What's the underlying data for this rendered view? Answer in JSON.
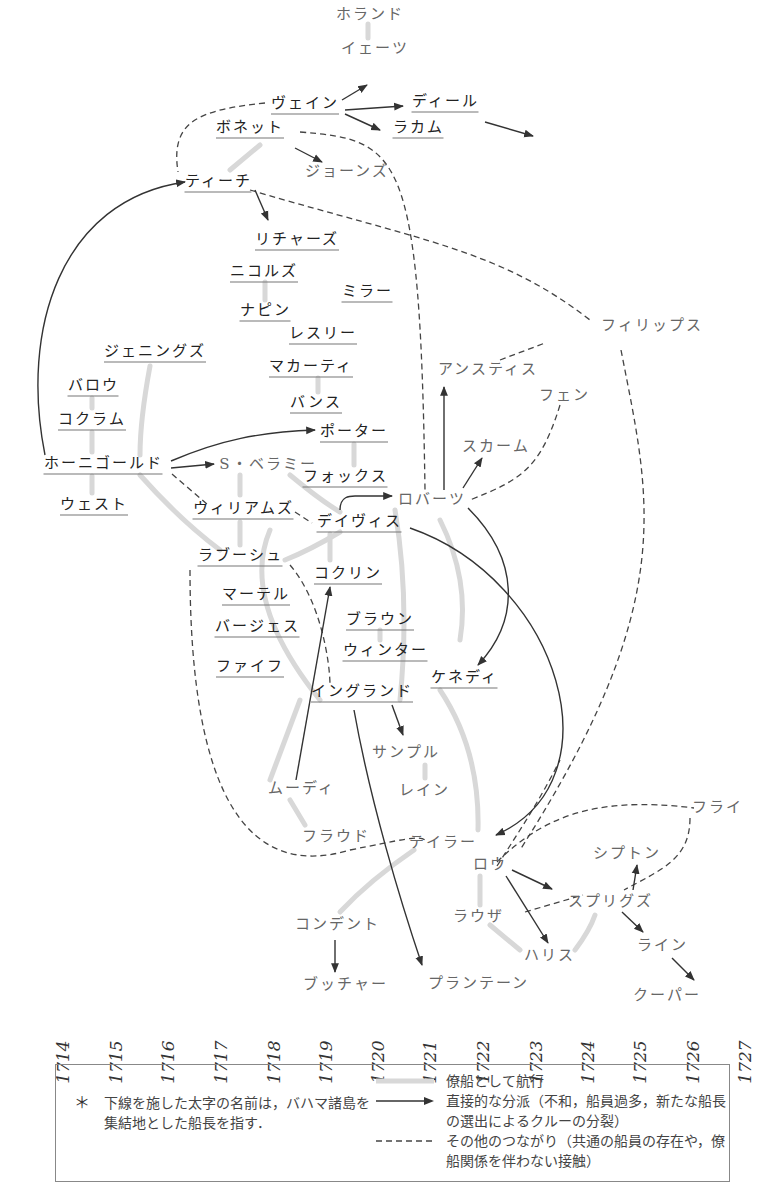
{
  "nodes": [
    {
      "id": "holland",
      "label": "ホランド",
      "x": 370,
      "y": 14,
      "bold": false
    },
    {
      "id": "yeats",
      "label": "イェーツ",
      "x": 375,
      "y": 48,
      "bold": false
    },
    {
      "id": "vane",
      "label": "ヴェイン",
      "x": 305,
      "y": 104,
      "bold": true
    },
    {
      "id": "deal",
      "label": "ディール",
      "x": 445,
      "y": 102,
      "bold": true
    },
    {
      "id": "rackam",
      "label": "ラカム",
      "x": 418,
      "y": 128,
      "bold": true
    },
    {
      "id": "bonnet",
      "label": "ボネット",
      "x": 250,
      "y": 128,
      "bold": true
    },
    {
      "id": "jones",
      "label": "ジョーンズ",
      "x": 347,
      "y": 171,
      "bold": false
    },
    {
      "id": "teach",
      "label": "ティーチ",
      "x": 218,
      "y": 182,
      "bold": true
    },
    {
      "id": "richards",
      "label": "リチャーズ",
      "x": 297,
      "y": 240,
      "bold": true
    },
    {
      "id": "nichols",
      "label": "ニコルズ",
      "x": 264,
      "y": 272,
      "bold": true
    },
    {
      "id": "miller",
      "label": "ミラー",
      "x": 367,
      "y": 292,
      "bold": true
    },
    {
      "id": "napin",
      "label": "ナピン",
      "x": 265,
      "y": 311,
      "bold": true
    },
    {
      "id": "leslie",
      "label": "レスリー",
      "x": 323,
      "y": 334,
      "bold": true
    },
    {
      "id": "jennings",
      "label": "ジェニングズ",
      "x": 155,
      "y": 352,
      "bold": true
    },
    {
      "id": "macarty",
      "label": "マカーティ",
      "x": 311,
      "y": 367,
      "bold": true
    },
    {
      "id": "barrow",
      "label": "バロウ",
      "x": 93,
      "y": 386,
      "bold": true
    },
    {
      "id": "bunce",
      "label": "バンス",
      "x": 316,
      "y": 403,
      "bold": true
    },
    {
      "id": "cocklyn_c",
      "label": "コクラム",
      "x": 92,
      "y": 420,
      "bold": true
    },
    {
      "id": "porter",
      "label": "ポーター",
      "x": 354,
      "y": 432,
      "bold": true
    },
    {
      "id": "hornigold",
      "label": "ホーニゴールド",
      "x": 103,
      "y": 464,
      "bold": true
    },
    {
      "id": "bellamy",
      "label": "S・ベラミー",
      "x": 268,
      "y": 464,
      "bold": false
    },
    {
      "id": "fox",
      "label": "フォックス",
      "x": 345,
      "y": 477,
      "bold": true
    },
    {
      "id": "west",
      "label": "ウェスト",
      "x": 94,
      "y": 505,
      "bold": true
    },
    {
      "id": "williams",
      "label": "ウィリアムズ",
      "x": 243,
      "y": 509,
      "bold": true
    },
    {
      "id": "roberts",
      "label": "ロバーツ",
      "x": 432,
      "y": 499,
      "bold": false
    },
    {
      "id": "davis",
      "label": "デイヴィス",
      "x": 359,
      "y": 522,
      "bold": true
    },
    {
      "id": "labouche",
      "label": "ラブーシュ",
      "x": 240,
      "y": 556,
      "bold": true
    },
    {
      "id": "cocklyn",
      "label": "コクリン",
      "x": 348,
      "y": 574,
      "bold": true
    },
    {
      "id": "martel",
      "label": "マーテル",
      "x": 256,
      "y": 595,
      "bold": true
    },
    {
      "id": "brown",
      "label": "ブラウン",
      "x": 380,
      "y": 620,
      "bold": true
    },
    {
      "id": "burgess",
      "label": "バージェス",
      "x": 257,
      "y": 627,
      "bold": true
    },
    {
      "id": "winter",
      "label": "ウィンター",
      "x": 385,
      "y": 651,
      "bold": true
    },
    {
      "id": "fife",
      "label": "ファイフ",
      "x": 250,
      "y": 667,
      "bold": true
    },
    {
      "id": "kennedy",
      "label": "ケネディ",
      "x": 464,
      "y": 678,
      "bold": true
    },
    {
      "id": "england",
      "label": "イングランド",
      "x": 362,
      "y": 692,
      "bold": true
    },
    {
      "id": "sample",
      "label": "サンプル",
      "x": 406,
      "y": 752,
      "bold": false
    },
    {
      "id": "moody",
      "label": "ムーディ",
      "x": 301,
      "y": 788,
      "bold": false
    },
    {
      "id": "lane",
      "label": "レイン",
      "x": 424,
      "y": 790,
      "bold": false
    },
    {
      "id": "frowd",
      "label": "フラウド",
      "x": 336,
      "y": 836,
      "bold": false
    },
    {
      "id": "taylor",
      "label": "テイラー",
      "x": 443,
      "y": 842,
      "bold": false
    },
    {
      "id": "fly",
      "label": "フライ",
      "x": 717,
      "y": 807,
      "bold": false
    },
    {
      "id": "low",
      "label": "ロウ",
      "x": 490,
      "y": 864,
      "bold": false
    },
    {
      "id": "shipton",
      "label": "シプトン",
      "x": 627,
      "y": 853,
      "bold": false
    },
    {
      "id": "spriggs",
      "label": "スプリグズ",
      "x": 610,
      "y": 901,
      "bold": false
    },
    {
      "id": "lowther",
      "label": "ラウザ",
      "x": 478,
      "y": 916,
      "bold": false
    },
    {
      "id": "condent",
      "label": "コンデント",
      "x": 337,
      "y": 924,
      "bold": false
    },
    {
      "id": "harris",
      "label": "ハリス",
      "x": 549,
      "y": 955,
      "bold": false
    },
    {
      "id": "lyne",
      "label": "ライン",
      "x": 662,
      "y": 945,
      "bold": false
    },
    {
      "id": "butcher",
      "label": "ブッチャー",
      "x": 345,
      "y": 984,
      "bold": false
    },
    {
      "id": "plantain",
      "label": "プランテーン",
      "x": 478,
      "y": 983,
      "bold": false
    },
    {
      "id": "cooper",
      "label": "クーパー",
      "x": 667,
      "y": 995,
      "bold": false
    },
    {
      "id": "phillips",
      "label": "フィリップス",
      "x": 652,
      "y": 325,
      "bold": false
    },
    {
      "id": "anstis",
      "label": "アンスティス",
      "x": 488,
      "y": 369,
      "bold": false
    },
    {
      "id": "fenn",
      "label": "フェン",
      "x": 564,
      "y": 395,
      "bold": false
    },
    {
      "id": "scarm",
      "label": "スカーム",
      "x": 496,
      "y": 446,
      "bold": false
    }
  ],
  "edges": {
    "consort": [
      "M368,24 L368,38",
      "M260,145 L230,170",
      "M265,282 L265,300",
      "M318,378 L318,392",
      "M354,444 L354,465",
      "M92,398 L92,408",
      "M92,432 L92,452",
      "M92,476 L92,493",
      "M150,366 Q140,420 140,455",
      "M140,475 Q180,520 220,550",
      "M240,475 L240,495",
      "M240,522 L240,545",
      "M290,475 Q320,500 340,512",
      "M340,532 Q310,550 285,560",
      "M330,534 L330,560",
      "M395,510 Q410,600 400,700",
      "M300,700 L270,780",
      "M290,800 L305,825",
      "M425,765 L425,778",
      "M440,520 Q470,580 460,640",
      "M440,690 Q480,750 478,830",
      "M270,530 Q240,600 320,700",
      "M380,630 L380,640",
      "M414,850 Q370,880 340,912",
      "M480,876 L480,905",
      "M490,925 L520,950",
      "M575,950 Q590,930 595,915"
    ],
    "schism": [
      {
        "d": "M45,455 C20,330 60,200 185,182",
        "arrow": true
      },
      {
        "d": "M255,190 L268,220",
        "arrow": true
      },
      {
        "d": "M342,100 L367,85",
        "arrow": true
      },
      {
        "d": "M345,110 L403,106",
        "arrow": true
      },
      {
        "d": "M345,114 L380,130",
        "arrow": true
      },
      {
        "d": "M295,148 L322,162",
        "arrow": true
      },
      {
        "d": "M171,461 C220,440 260,432 315,430",
        "arrow": true
      },
      {
        "d": "M171,468 L214,464",
        "arrow": true
      },
      {
        "d": "M340,510 C340,496 350,496 355,496 L392,496",
        "arrow": true
      },
      {
        "d": "M444,490 L444,387",
        "arrow": true
      },
      {
        "d": "M463,488 L482,458",
        "arrow": true
      },
      {
        "d": "M468,508 C520,560 520,620 478,665",
        "arrow": true
      },
      {
        "d": "M410,528 C560,580 620,780 496,835",
        "arrow": true
      },
      {
        "d": "M296,780 L330,587",
        "arrow": true
      },
      {
        "d": "M392,705 L403,735",
        "arrow": true
      },
      {
        "d": "M354,710 C370,800 400,900 422,965",
        "arrow": true
      },
      {
        "d": "M335,940 L335,972",
        "arrow": true
      },
      {
        "d": "M485,122 L533,136",
        "arrow": true
      },
      {
        "d": "M512,870 L552,889",
        "arrow": true
      },
      {
        "d": "M506,876 L548,943",
        "arrow": true
      },
      {
        "d": "M633,890 L637,865",
        "arrow": true
      },
      {
        "d": "M622,912 L643,932",
        "arrow": true
      },
      {
        "d": "M672,958 L694,980",
        "arrow": true
      }
    ],
    "other": [
      "M265,103 C200,110 170,120 178,172",
      "M300,132 C400,140 420,150 425,490",
      "M250,190 C420,240 500,250 590,320",
      "M500,360 L545,343",
      "M621,350 C650,500 680,600 520,850",
      "M560,405 C540,470 520,480 470,500",
      "M172,474 L208,505",
      "M295,512 L312,523",
      "M290,565 C320,600 330,660 330,686",
      "M190,570 C190,800 250,880 350,850 C400,840 420,835 425,840",
      "M497,862 C540,820 590,795 694,808",
      "M497,866 C520,830 540,800 560,760",
      "M690,818 C690,860 660,870 624,890",
      "M525,912 L583,895"
    ]
  },
  "years": [
    "1714",
    "1715",
    "1716",
    "1717",
    "1718",
    "1719",
    "1720",
    "1721",
    "1722",
    "1723",
    "1724",
    "1725",
    "1726",
    "1727"
  ],
  "year_x": [
    63,
    116,
    168,
    221,
    274,
    326,
    378,
    430,
    483,
    536,
    588,
    640,
    693,
    745
  ],
  "legend": {
    "note_star": "＊",
    "note_text": "下線を施した太字の名前は，バハマ諸島を集結地とした船長を指す．",
    "consort_label": "僚船として航行",
    "schism_label": "直接的な分派（不和，船員過多，新たな船長の選出によるクルーの分裂）",
    "other_label": "その他のつながり（共通の船員の存在や，僚船関係を伴わない接触）"
  },
  "colors": {
    "consort_line": "#d8d8d8",
    "schism_line": "#333333",
    "other_line": "#444444",
    "underline": "#777777"
  }
}
